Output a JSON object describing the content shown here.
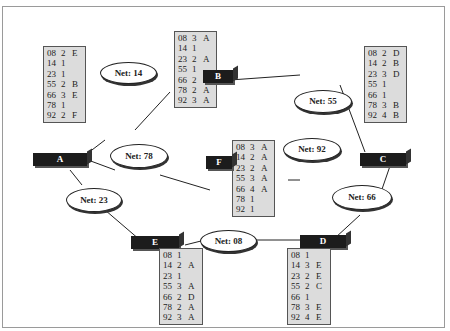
{
  "diagram": {
    "routers": [
      {
        "id": "A",
        "label": "A",
        "table": [
          [
            "08",
            "2",
            "E"
          ],
          [
            "14",
            "1",
            ""
          ],
          [
            "23",
            "1",
            ""
          ],
          [
            "55",
            "2",
            "B"
          ],
          [
            "66",
            "3",
            "E"
          ],
          [
            "78",
            "1",
            ""
          ],
          [
            "92",
            "2",
            "F"
          ]
        ]
      },
      {
        "id": "B",
        "label": "B",
        "table": [
          [
            "08",
            "3",
            "A"
          ],
          [
            "14",
            "1",
            ""
          ],
          [
            "23",
            "2",
            "A"
          ],
          [
            "55",
            "1",
            ""
          ],
          [
            "66",
            "2",
            "C"
          ],
          [
            "78",
            "2",
            "A"
          ],
          [
            "92",
            "3",
            "A"
          ]
        ]
      },
      {
        "id": "C",
        "label": "C",
        "table": [
          [
            "08",
            "2",
            "D"
          ],
          [
            "14",
            "2",
            "B"
          ],
          [
            "23",
            "3",
            "D"
          ],
          [
            "55",
            "1",
            ""
          ],
          [
            "66",
            "1",
            ""
          ],
          [
            "78",
            "3",
            "B"
          ],
          [
            "92",
            "4",
            "B"
          ]
        ]
      },
      {
        "id": "F",
        "label": "F",
        "table": [
          [
            "08",
            "3",
            "A"
          ],
          [
            "14",
            "2",
            "A"
          ],
          [
            "23",
            "2",
            "A"
          ],
          [
            "55",
            "3",
            "A"
          ],
          [
            "66",
            "4",
            "A"
          ],
          [
            "78",
            "1",
            ""
          ],
          [
            "92",
            "1",
            ""
          ]
        ]
      },
      {
        "id": "E",
        "label": "E",
        "table": [
          [
            "08",
            "1",
            ""
          ],
          [
            "14",
            "2",
            "A"
          ],
          [
            "23",
            "1",
            ""
          ],
          [
            "55",
            "3",
            "A"
          ],
          [
            "66",
            "2",
            "D"
          ],
          [
            "78",
            "2",
            "A"
          ],
          [
            "92",
            "3",
            "A"
          ]
        ]
      },
      {
        "id": "D",
        "label": "D",
        "table": [
          [
            "08",
            "1",
            ""
          ],
          [
            "14",
            "3",
            "E"
          ],
          [
            "23",
            "2",
            "E"
          ],
          [
            "55",
            "2",
            "C"
          ],
          [
            "66",
            "1",
            ""
          ],
          [
            "78",
            "3",
            "E"
          ],
          [
            "92",
            "4",
            "E"
          ]
        ]
      }
    ],
    "networks": [
      {
        "id": "14",
        "label": "Net: 14"
      },
      {
        "id": "55",
        "label": "Net: 55"
      },
      {
        "id": "78",
        "label": "Net: 78"
      },
      {
        "id": "92",
        "label": "Net: 92"
      },
      {
        "id": "23",
        "label": "Net: 23"
      },
      {
        "id": "66",
        "label": "Net: 66"
      },
      {
        "id": "08",
        "label": "Net: 08"
      }
    ]
  }
}
